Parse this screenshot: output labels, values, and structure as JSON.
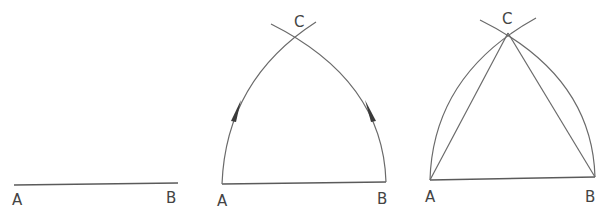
{
  "diagram": {
    "title": "",
    "colors": {
      "line": "#6a6a6a",
      "label": "#444444",
      "arrow": "#3a3a3a",
      "background": "#ffffff"
    },
    "panels": [
      {
        "id": "step1",
        "description": "Segment AB",
        "points": {
          "A": [
            14,
            185
          ],
          "B": [
            178,
            183
          ]
        },
        "labels": {
          "A": "A",
          "B": "B"
        }
      },
      {
        "id": "step2",
        "description": "Arcs centered at A and B with radius AB intersecting at C",
        "points": {
          "A": [
            222,
            184
          ],
          "B": [
            386,
            182
          ],
          "C": [
            299,
            37
          ]
        },
        "labels": {
          "A": "A",
          "B": "B",
          "C": "C"
        },
        "arrows": [
          "arc-from-A-upward",
          "arc-from-B-upward"
        ]
      },
      {
        "id": "step3",
        "description": "Equilateral triangle ABC with construction arcs",
        "points": {
          "A": [
            430,
            180
          ],
          "B": [
            595,
            177
          ],
          "C": [
            508,
            33
          ]
        },
        "labels": {
          "A": "A",
          "B": "B",
          "C": "C"
        }
      }
    ]
  }
}
